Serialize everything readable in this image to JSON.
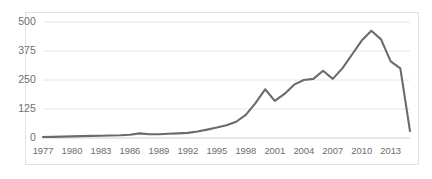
{
  "chart_data": {
    "type": "line",
    "title": "",
    "subtitle": "",
    "xlabel": "",
    "ylabel": "",
    "xlim": [
      1977,
      2015
    ],
    "ylim": [
      0,
      500
    ],
    "grid": true,
    "gridlines_horizontal": [
      0,
      125,
      250,
      375,
      500
    ],
    "legend": null,
    "legend_position": "none",
    "line_color": "#6b6b6b",
    "y_ticks": [
      "0",
      "125",
      "250",
      "375",
      "500"
    ],
    "y_tick_values": [
      0,
      125,
      250,
      375,
      500
    ],
    "x_ticks": [
      "1977",
      "1980",
      "1983",
      "1986",
      "1989",
      "1992",
      "1995",
      "1998",
      "2001",
      "2004",
      "2007",
      "2010",
      "2013"
    ],
    "x_tick_values": [
      1977,
      1980,
      1983,
      1986,
      1989,
      1992,
      1995,
      1998,
      2001,
      2004,
      2007,
      2010,
      2013
    ],
    "x": [
      1977,
      1978,
      1979,
      1980,
      1981,
      1982,
      1983,
      1984,
      1985,
      1986,
      1987,
      1988,
      1989,
      1990,
      1991,
      1992,
      1993,
      1994,
      1995,
      1996,
      1997,
      1998,
      1999,
      2000,
      2001,
      2002,
      2003,
      2004,
      2005,
      2006,
      2007,
      2008,
      2009,
      2010,
      2011,
      2012,
      2013,
      2014,
      2015
    ],
    "values": [
      4,
      5,
      6,
      7,
      8,
      9,
      10,
      11,
      12,
      14,
      20,
      16,
      16,
      18,
      20,
      22,
      28,
      36,
      45,
      55,
      70,
      100,
      150,
      210,
      160,
      190,
      230,
      250,
      255,
      290,
      255,
      300,
      360,
      420,
      462,
      425,
      330,
      300,
      30
    ],
    "series": [
      {
        "name": "series-1",
        "color": "#6b6b6b",
        "values": [
          4,
          5,
          6,
          7,
          8,
          9,
          10,
          11,
          12,
          14,
          20,
          16,
          16,
          18,
          20,
          22,
          28,
          36,
          45,
          55,
          70,
          100,
          150,
          210,
          160,
          190,
          230,
          250,
          255,
          290,
          255,
          300,
          360,
          420,
          462,
          425,
          330,
          300,
          30
        ]
      }
    ],
    "annotations": []
  }
}
